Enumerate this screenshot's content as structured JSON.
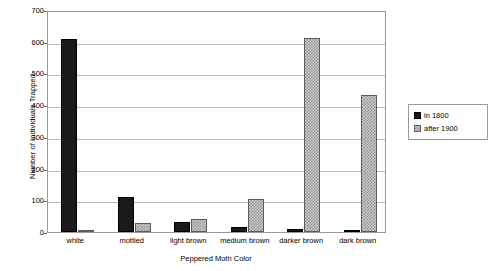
{
  "chart_data": {
    "type": "bar",
    "title": "",
    "xlabel": "Peppered Moth Color",
    "ylabel": "Number of Individuals Trapped",
    "categories": [
      "white",
      "mottled",
      "light brown",
      "medium brown",
      "darker brown",
      "dark brown"
    ],
    "series": [
      {
        "name": "in 1800",
        "values": [
          610,
          110,
          32,
          15,
          8,
          3
        ]
      },
      {
        "name": "after 1900",
        "values": [
          6,
          27,
          42,
          105,
          612,
          432
        ]
      }
    ],
    "ylim": [
      0,
      700
    ],
    "yticks": [
      0,
      100,
      200,
      300,
      400,
      500,
      600,
      700
    ],
    "ytick_labels": [
      "0",
      "100",
      "200",
      "300",
      "400",
      "500",
      "600",
      "700"
    ],
    "grid": true,
    "legend_position": "right",
    "colors": {
      "series_in_1800": "#1a1a1a",
      "series_after_1900": "#c9c9c9",
      "gridline": "#b8b8b8",
      "axis": "#9a9a9a",
      "background": "#ffffff",
      "text": "#000000"
    }
  }
}
